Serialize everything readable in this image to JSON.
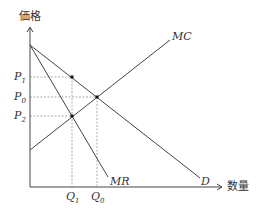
{
  "axes": {
    "y_label": "価格",
    "x_label": "数量"
  },
  "curves": {
    "demand": "D",
    "marginal_revenue": "MR",
    "marginal_cost": "MC"
  },
  "price_ticks": [
    {
      "base": "P",
      "sub": "1"
    },
    {
      "base": "P",
      "sub": "0"
    },
    {
      "base": "P",
      "sub": "2"
    }
  ],
  "quantity_ticks": [
    {
      "base": "Q",
      "sub": "1"
    },
    {
      "base": "Q",
      "sub": "0"
    }
  ],
  "colors": {
    "line": "#444444",
    "guide": "#888888"
  }
}
